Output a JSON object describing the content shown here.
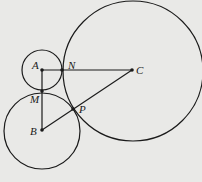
{
  "diagram": {
    "type": "geometry",
    "stroke_color": "#1a1a1a",
    "background": "#e9e9e7",
    "points": {
      "A": {
        "label": "A",
        "x": 42,
        "y": 70
      },
      "B": {
        "label": "B",
        "x": 42,
        "y": 130
      },
      "C": {
        "label": "C",
        "x": 132,
        "y": 70
      },
      "M": {
        "label": "M",
        "x": 42,
        "y": 91
      },
      "N": {
        "label": "N",
        "x": 62,
        "y": 70
      },
      "P": {
        "label": "P",
        "x": 73,
        "y": 109
      }
    },
    "circles": [
      {
        "center": "A",
        "r": 20
      },
      {
        "center": "B",
        "r": 38
      },
      {
        "center": "C",
        "r": 70
      }
    ],
    "segments": [
      [
        "A",
        "C"
      ],
      [
        "A",
        "B"
      ],
      [
        "B",
        "C"
      ]
    ]
  }
}
